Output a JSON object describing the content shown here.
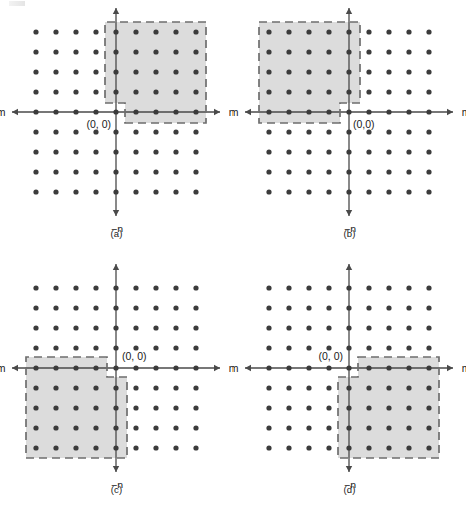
{
  "figure": {
    "type": "diagram",
    "grid": {
      "dot_count_x": 9,
      "dot_count_y": 9,
      "spacing_px": 20,
      "dot_color": "#3b3b3b",
      "dot_radius_px": 2.6
    },
    "style": {
      "axis_color": "#4a4a4a",
      "shade_fill": "#dcdcdc",
      "dash_color": "#6e6e6e",
      "label_color": "#1a1a1a"
    },
    "axis_labels": {
      "m_positive": "m",
      "m_negative": "−m",
      "n_positive": "n",
      "n_negative": "−n"
    },
    "panels": [
      {
        "id": "a",
        "caption": "(a)",
        "origin_label": "(0, 0)",
        "origin_label_pos": "below-left",
        "quadrant": "first",
        "region": "first-quadrant support with one-cell notch at origin corner",
        "notch_corner": "lower-left",
        "region_span_x": [
          0,
          4
        ],
        "region_span_y": [
          0,
          4
        ]
      },
      {
        "id": "b",
        "caption": "(b)",
        "origin_label": "(0,0)",
        "origin_label_pos": "below-right",
        "quadrant": "second",
        "region": "second-quadrant support with one-cell notch at origin corner",
        "notch_corner": "lower-right",
        "region_span_x": [
          -4,
          0
        ],
        "region_span_y": [
          0,
          4
        ]
      },
      {
        "id": "c",
        "caption": "(c)",
        "origin_label": "(0, 0)",
        "origin_label_pos": "above-right",
        "quadrant": "third",
        "region": "third-quadrant support with one-cell notch at origin corner",
        "notch_corner": "upper-right",
        "region_span_x": [
          -4,
          0
        ],
        "region_span_y": [
          -4,
          0
        ]
      },
      {
        "id": "d",
        "caption": "(d)",
        "origin_label": "(0, 0)",
        "origin_label_pos": "above-left",
        "quadrant": "fourth",
        "region": "fourth-quadrant support with one-cell notch at origin corner",
        "notch_corner": "upper-left",
        "region_span_x": [
          0,
          4
        ],
        "region_span_y": [
          -4,
          0
        ]
      }
    ]
  }
}
